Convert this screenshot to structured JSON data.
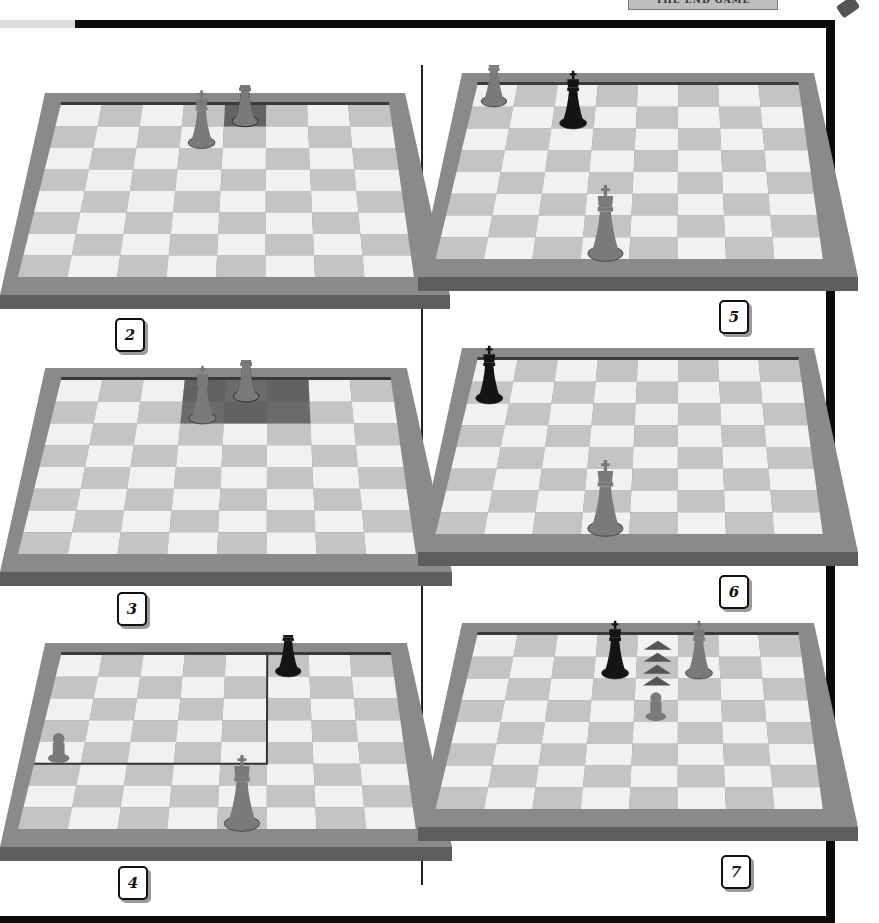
{
  "header": {
    "title": "THE END GAME"
  },
  "colors": {
    "frame": "#0b0b0b",
    "board_border": "#8a8a8a",
    "board_edge": "#5e5e5e",
    "light_square": "#f1f1f1",
    "dark_square": "#c4c4c4",
    "highlight": "#4a4a4a",
    "black_piece": "#141414",
    "white_piece": "#7a7a7a"
  },
  "diagrams": [
    {
      "number": "2",
      "pieces": [
        {
          "type": "king",
          "color": "black",
          "file": 4,
          "rank": 0
        },
        {
          "type": "king",
          "color": "white",
          "file": 3,
          "rank": 1
        },
        {
          "type": "pawn-king",
          "color": "white",
          "file": 4,
          "rank": 0
        }
      ],
      "highlight": "single square behind pieces"
    },
    {
      "number": "3",
      "pieces": [
        {
          "type": "king",
          "color": "black",
          "file": 4,
          "rank": 0
        },
        {
          "type": "king",
          "color": "white",
          "file": 3,
          "rank": 1
        },
        {
          "type": "king",
          "color": "white",
          "file": 4,
          "rank": 0
        }
      ],
      "highlight": "3x2 dark region"
    },
    {
      "number": "4",
      "pieces": [
        {
          "type": "king",
          "color": "black",
          "file": 5,
          "rank": 0
        },
        {
          "type": "pawn",
          "color": "white",
          "file": 0,
          "rank": 4
        },
        {
          "type": "king",
          "color": "white",
          "file": 4,
          "rank": 7
        }
      ],
      "highlight": "square of the pawn outline"
    },
    {
      "number": "5",
      "pieces": [
        {
          "type": "king",
          "color": "white",
          "file": 0,
          "rank": 0
        },
        {
          "type": "king",
          "color": "black",
          "file": 2,
          "rank": 1
        },
        {
          "type": "king",
          "color": "white",
          "file": 3,
          "rank": 7
        }
      ]
    },
    {
      "number": "6",
      "pieces": [
        {
          "type": "king",
          "color": "black",
          "file": 0,
          "rank": 1
        },
        {
          "type": "king",
          "color": "white",
          "file": 3,
          "rank": 7
        }
      ]
    },
    {
      "number": "7",
      "pieces": [
        {
          "type": "king",
          "color": "black",
          "file": 3,
          "rank": 1
        },
        {
          "type": "king",
          "color": "white",
          "file": 5,
          "rank": 1
        },
        {
          "type": "pawn",
          "color": "white",
          "file": 4,
          "rank": 3
        }
      ],
      "arrows": "pawn advance arrows toward top rank"
    }
  ]
}
